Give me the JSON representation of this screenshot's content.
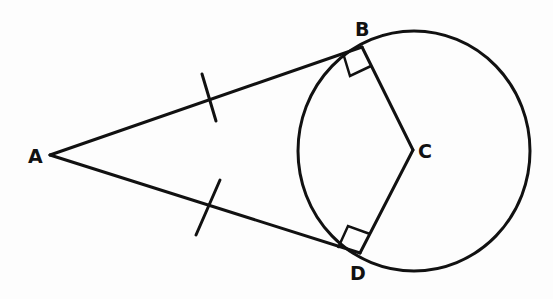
{
  "diagram": {
    "labels": {
      "A": "A",
      "B": "B",
      "C": "C",
      "D": "D"
    },
    "points": {
      "A": [
        50,
        155
      ],
      "B": [
        362,
        47
      ],
      "C": [
        413,
        150
      ],
      "D": [
        360,
        253
      ]
    },
    "circle": {
      "cx": 414,
      "cy": 151,
      "rx": 116,
      "ry": 120
    },
    "segments": [
      "AB",
      "AD",
      "BC",
      "DC"
    ],
    "tick_marks": [
      {
        "on": "AB",
        "meaning": "congruent segment mark"
      },
      {
        "on": "AD",
        "meaning": "congruent segment mark"
      }
    ],
    "right_angles": [
      "ABC",
      "ADC"
    ],
    "colors": {
      "ink": "#111111",
      "paper": "#fdfdfd"
    }
  }
}
